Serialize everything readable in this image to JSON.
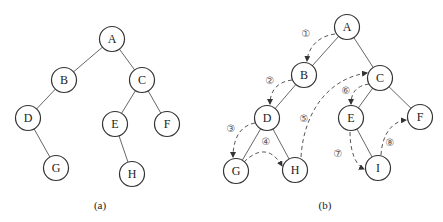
{
  "figure_a": {
    "caption": "(a)",
    "nodes": [
      {
        "id": "A",
        "label": "A"
      },
      {
        "id": "B",
        "label": "B"
      },
      {
        "id": "C",
        "label": "C"
      },
      {
        "id": "D",
        "label": "D"
      },
      {
        "id": "E",
        "label": "E"
      },
      {
        "id": "F",
        "label": "F"
      },
      {
        "id": "G",
        "label": "G"
      },
      {
        "id": "H",
        "label": "H"
      }
    ],
    "edges": [
      [
        "A",
        "B"
      ],
      [
        "A",
        "C"
      ],
      [
        "B",
        "D"
      ],
      [
        "D",
        "G"
      ],
      [
        "C",
        "E"
      ],
      [
        "C",
        "F"
      ],
      [
        "E",
        "H"
      ]
    ]
  },
  "figure_b": {
    "caption": "(b)",
    "nodes": [
      {
        "id": "A",
        "label": "A"
      },
      {
        "id": "B",
        "label": "B"
      },
      {
        "id": "C",
        "label": "C"
      },
      {
        "id": "D",
        "label": "D"
      },
      {
        "id": "E",
        "label": "E"
      },
      {
        "id": "F",
        "label": "F"
      },
      {
        "id": "G",
        "label": "G"
      },
      {
        "id": "H",
        "label": "H"
      },
      {
        "id": "I",
        "label": "I"
      }
    ],
    "edges": [
      [
        "A",
        "B"
      ],
      [
        "A",
        "C"
      ],
      [
        "B",
        "D"
      ],
      [
        "D",
        "G"
      ],
      [
        "D",
        "H"
      ],
      [
        "G",
        "H"
      ],
      [
        "C",
        "E"
      ],
      [
        "C",
        "F"
      ],
      [
        "E",
        "I"
      ]
    ],
    "steps": [
      {
        "label": "①",
        "from": "A",
        "to": "B"
      },
      {
        "label": "②",
        "from": "B",
        "to": "D"
      },
      {
        "label": "③",
        "from": "D",
        "to": "G"
      },
      {
        "label": "④",
        "from": "G",
        "to": "H"
      },
      {
        "label": "⑤",
        "from": "H",
        "to": "C"
      },
      {
        "label": "⑥",
        "from": "C",
        "to": "E"
      },
      {
        "label": "⑦",
        "from": "E",
        "to": "I"
      },
      {
        "label": "⑧",
        "from": "I",
        "to": "F"
      }
    ]
  }
}
